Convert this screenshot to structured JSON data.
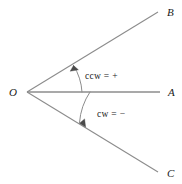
{
  "diagram": {
    "background_color": "#ffffff",
    "line_color": "#8c8c8c",
    "arc_color": "#8c8c8c",
    "text_color": "#1a1a1a",
    "vertex": {
      "name": "origin-vertex",
      "label": "O",
      "x": 27,
      "y": 92,
      "label_x": 13,
      "label_y": 96
    },
    "rays": [
      {
        "name": "ray-ob",
        "label": "B",
        "from_x": 27,
        "from_y": 92,
        "to_x": 158,
        "to_y": 12,
        "label_x": 167,
        "label_y": 16,
        "direction": "upper-right"
      },
      {
        "name": "ray-oa",
        "label": "A",
        "from_x": 27,
        "from_y": 92,
        "to_x": 160,
        "to_y": 92,
        "label_x": 168,
        "label_y": 96,
        "direction": "right"
      },
      {
        "name": "ray-oc",
        "label": "C",
        "from_x": 27,
        "from_y": 92,
        "to_x": 158,
        "to_y": 172,
        "label_x": 167,
        "label_y": 177,
        "direction": "lower-right"
      }
    ],
    "arcs": [
      {
        "name": "ccw-arc",
        "label": "ccw = +",
        "sense": "counterclockwise",
        "sign": "+",
        "label_x": 85,
        "label_y": 79,
        "path": "M 82 92 A 55 55 0 0 0 73.5 65.5",
        "arrow_points": "73.5,65.5 78.2,69.6 70.4,71.0",
        "radius": 55
      },
      {
        "name": "cw-arc",
        "label": "cw = −",
        "sense": "clockwise",
        "sign": "−",
        "label_x": 97,
        "label_y": 117,
        "path": "M 90 92 A 63 63 0 0 0 79.5 122.5",
        "arrow_points": "79.5,122.5 84.3,118.8 85.1,126.4",
        "radius": 63
      }
    ]
  }
}
